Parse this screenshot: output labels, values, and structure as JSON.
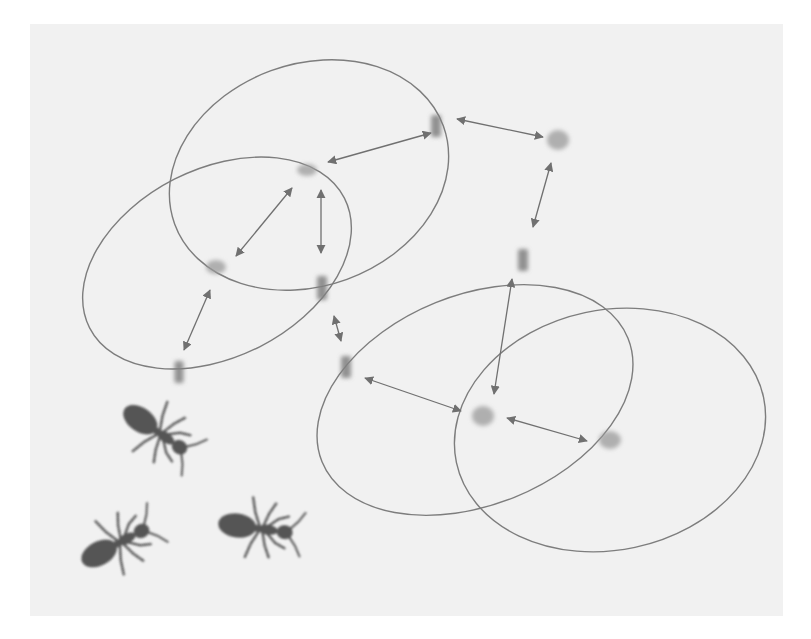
{
  "canvas": {
    "width": 811,
    "height": 639,
    "background": "#ffffff"
  },
  "panel": {
    "x": 30,
    "y": 24,
    "width": 753,
    "height": 592,
    "fill": "#f1f1f1"
  },
  "colors": {
    "ellipse_stroke": "#7d7d7d",
    "arrow": "#707070",
    "node": "#9a9a9a",
    "node_dark": "#808080",
    "ant": "#555555"
  },
  "ellipses": [
    {
      "id": "range-top",
      "cx": 309,
      "cy": 175,
      "rx": 143,
      "ry": 111,
      "rotate": -20
    },
    {
      "id": "range-left",
      "cx": 217,
      "cy": 263,
      "rx": 143,
      "ry": 94,
      "rotate": -27
    },
    {
      "id": "range-bottom-mid",
      "cx": 475,
      "cy": 400,
      "rx": 165,
      "ry": 105,
      "rotate": -22
    },
    {
      "id": "range-bottom-right",
      "cx": 610,
      "cy": 430,
      "rx": 157,
      "ry": 120,
      "rotate": -12
    }
  ],
  "nodes": [
    {
      "id": "n1",
      "x": 307,
      "y": 170,
      "w": 20,
      "h": 12,
      "shape": "blob"
    },
    {
      "id": "n2",
      "x": 436,
      "y": 126,
      "w": 10,
      "h": 22,
      "shape": "bar"
    },
    {
      "id": "n3",
      "x": 558,
      "y": 140,
      "w": 22,
      "h": 20,
      "shape": "blob"
    },
    {
      "id": "n4",
      "x": 216,
      "y": 267,
      "w": 20,
      "h": 14,
      "shape": "blob"
    },
    {
      "id": "n5",
      "x": 322,
      "y": 288,
      "w": 10,
      "h": 24,
      "shape": "bar"
    },
    {
      "id": "n6",
      "x": 523,
      "y": 260,
      "w": 10,
      "h": 22,
      "shape": "bar"
    },
    {
      "id": "n7",
      "x": 179,
      "y": 372,
      "w": 9,
      "h": 22,
      "shape": "bar"
    },
    {
      "id": "n8",
      "x": 346,
      "y": 367,
      "w": 10,
      "h": 22,
      "shape": "bar"
    },
    {
      "id": "n9",
      "x": 483,
      "y": 416,
      "w": 22,
      "h": 20,
      "shape": "blob"
    },
    {
      "id": "n10",
      "x": 610,
      "y": 440,
      "w": 22,
      "h": 18,
      "shape": "blob"
    }
  ],
  "edges": [
    {
      "from": "n1",
      "to": "n2",
      "x1": 328,
      "y1": 162,
      "x2": 431,
      "y2": 133
    },
    {
      "from": "n1",
      "to": "n4",
      "x1": 292,
      "y1": 188,
      "x2": 236,
      "y2": 256
    },
    {
      "from": "n1",
      "to": "n5",
      "x1": 321,
      "y1": 190,
      "x2": 321,
      "y2": 253
    },
    {
      "from": "n2",
      "to": "n3",
      "x1": 457,
      "y1": 119,
      "x2": 543,
      "y2": 137
    },
    {
      "from": "n3",
      "to": "n6",
      "x1": 551,
      "y1": 163,
      "x2": 533,
      "y2": 227
    },
    {
      "from": "n4",
      "to": "n7",
      "x1": 210,
      "y1": 290,
      "x2": 184,
      "y2": 350
    },
    {
      "from": "n5",
      "to": "n8",
      "x1": 334,
      "y1": 316,
      "x2": 341,
      "y2": 341
    },
    {
      "from": "n8",
      "to": "n9",
      "x1": 365,
      "y1": 378,
      "x2": 461,
      "y2": 411
    },
    {
      "from": "n6",
      "to": "n9",
      "x1": 512,
      "y1": 279,
      "x2": 494,
      "y2": 394
    },
    {
      "from": "n9",
      "to": "n10",
      "x1": 507,
      "y1": 418,
      "x2": 587,
      "y2": 441
    }
  ],
  "ants": [
    {
      "id": "ant-1",
      "x": 155,
      "y": 430,
      "rotate": 35,
      "scale": 1.0
    },
    {
      "id": "ant-2",
      "x": 115,
      "y": 545,
      "rotate": -28,
      "scale": 1.0
    },
    {
      "id": "ant-3",
      "x": 255,
      "y": 528,
      "rotate": 8,
      "scale": 1.0
    }
  ]
}
